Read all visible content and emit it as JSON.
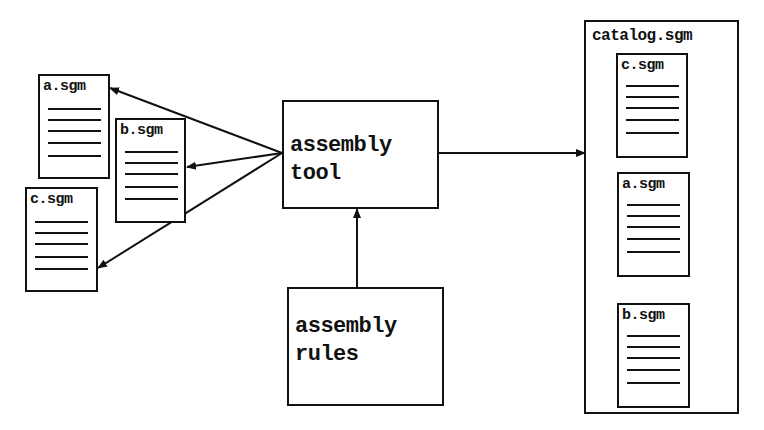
{
  "diagram": {
    "source_docs": [
      {
        "label": "a.sgm",
        "lines": 5
      },
      {
        "label": "b.sgm",
        "lines": 5
      },
      {
        "label": "c.sgm",
        "lines": 5
      }
    ],
    "tool": {
      "label": "assembly\ntool"
    },
    "rules": {
      "label": "assembly\nrules"
    },
    "catalog": {
      "label": "catalog.sgm",
      "docs": [
        {
          "label": "c.sgm",
          "lines": 5
        },
        {
          "label": "a.sgm",
          "lines": 5
        },
        {
          "label": "b.sgm",
          "lines": 5
        }
      ]
    },
    "edges": [
      {
        "from": "assembly tool",
        "to": "a.sgm"
      },
      {
        "from": "assembly tool",
        "to": "b.sgm"
      },
      {
        "from": "assembly tool",
        "to": "c.sgm"
      },
      {
        "from": "assembly rules",
        "to": "assembly tool"
      },
      {
        "from": "assembly tool",
        "to": "catalog.sgm"
      }
    ],
    "colors": {
      "stroke": "#111111",
      "background": "#ffffff"
    }
  }
}
